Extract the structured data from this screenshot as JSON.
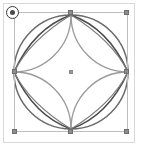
{
  "app": {
    "name": "vector-shape-editor-canvas",
    "background_color": "#ffffff"
  },
  "canvas": {
    "frame_border_color": "#d8d8d8",
    "width": 143,
    "height": 157
  },
  "shape": {
    "name": "four-petal-rosette",
    "description": "Circle with four inward petal arcs forming an astroid rosette",
    "stroke_color": "#5a5a5a",
    "accent_stroke_color": "#8e8e8e",
    "fill": "none",
    "stroke_width": "1.4",
    "center_x": 71,
    "center_y": 72,
    "radius": 57
  },
  "selection": {
    "label": "Selection bounding box",
    "border_color": "#bdbdbd",
    "left": 14,
    "top": 12,
    "width": 114,
    "height": 120,
    "handle_color": "#8c8c8c",
    "handles": [
      {
        "position": "top-left",
        "name": "resize-handle-top-left"
      },
      {
        "position": "top-center",
        "name": "resize-handle-top-center"
      },
      {
        "position": "top-right",
        "name": "resize-handle-top-right"
      },
      {
        "position": "middle-left",
        "name": "resize-handle-middle-left"
      },
      {
        "position": "middle-right",
        "name": "resize-handle-middle-right"
      },
      {
        "position": "bottom-left",
        "name": "resize-handle-bottom-left"
      },
      {
        "position": "bottom-center",
        "name": "resize-handle-bottom-center"
      },
      {
        "position": "bottom-right",
        "name": "resize-handle-bottom-right"
      }
    ]
  },
  "rotation_handle": {
    "label": "Rotate",
    "border_color": "#3a3a3a",
    "dot_color": "#4a4a4a"
  },
  "center_marker": {
    "label": "Transform origin",
    "color": "#9a9a9a"
  }
}
